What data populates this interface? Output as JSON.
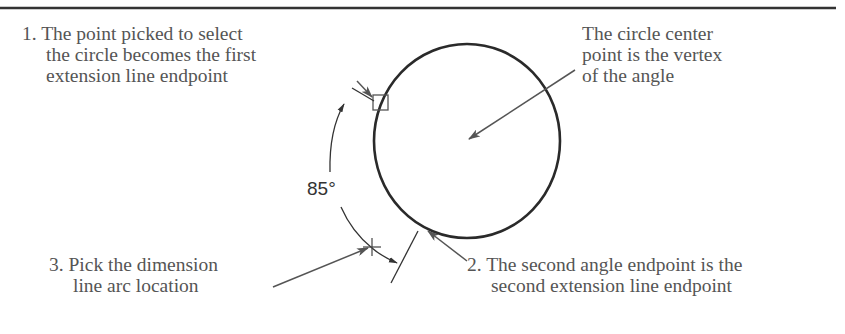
{
  "figure": {
    "top_rule": true,
    "colors": {
      "circle": "#2a2a2a",
      "leader": "#555555",
      "text": "#555555",
      "angle_text": "#333333"
    },
    "callouts": {
      "step1": {
        "number": "1.",
        "lines": [
          "The point picked to select",
          "the circle becomes the first",
          "extension line endpoint"
        ]
      },
      "center": {
        "lines": [
          "The circle center",
          "point is the vertex",
          "of the angle"
        ]
      },
      "step3": {
        "number": "3.",
        "lines": [
          "Pick the dimension",
          "line arc location"
        ]
      },
      "step2": {
        "number": "2.",
        "lines": [
          "The second angle endpoint is the",
          "second extension line endpoint"
        ]
      }
    },
    "angle_dimension": {
      "value": "85°"
    },
    "icons": {
      "pick_box": "square-pick-box",
      "pick_point": "plus-crosshair"
    }
  }
}
